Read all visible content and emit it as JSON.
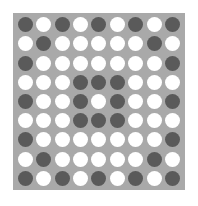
{
  "board": {
    "rows": 9,
    "cols": 9,
    "colors": {
      "board": "#a9a9a9",
      "dark": "#5a5a5a",
      "light": "#ffffff"
    },
    "grid": [
      [
        "D",
        "W",
        "D",
        "W",
        "D",
        "W",
        "D",
        "W",
        "D"
      ],
      [
        "W",
        "D",
        "W",
        "W",
        "W",
        "W",
        "W",
        "D",
        "W"
      ],
      [
        "D",
        "W",
        "W",
        "W",
        "W",
        "W",
        "W",
        "W",
        "D"
      ],
      [
        "W",
        "W",
        "W",
        "D",
        "D",
        "D",
        "W",
        "W",
        "W"
      ],
      [
        "D",
        "W",
        "W",
        "D",
        "W",
        "D",
        "W",
        "W",
        "D"
      ],
      [
        "W",
        "W",
        "W",
        "D",
        "D",
        "D",
        "W",
        "W",
        "W"
      ],
      [
        "D",
        "W",
        "W",
        "W",
        "W",
        "W",
        "W",
        "W",
        "D"
      ],
      [
        "W",
        "D",
        "W",
        "W",
        "W",
        "W",
        "W",
        "D",
        "W"
      ],
      [
        "D",
        "W",
        "D",
        "W",
        "D",
        "W",
        "D",
        "W",
        "D"
      ]
    ]
  }
}
